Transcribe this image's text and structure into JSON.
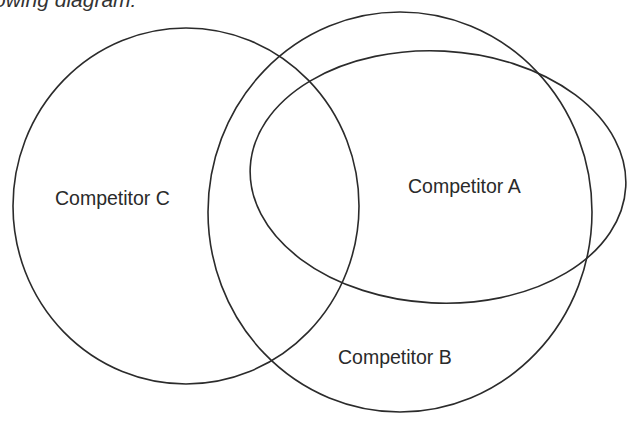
{
  "caption": {
    "text": "following diagram:",
    "visible_fragment": "owing diagram:"
  },
  "diagram": {
    "type": "venn",
    "stroke_color": "#2b2b2b",
    "sets": [
      {
        "id": "A",
        "label": "Competitor A",
        "shape": "ellipse",
        "cx": 438,
        "cy": 177,
        "rx": 188,
        "ry": 126,
        "rotation": 3,
        "label_x": 408,
        "label_y": 193
      },
      {
        "id": "B",
        "label": "Competitor B",
        "shape": "ellipse",
        "cx": 400,
        "cy": 212,
        "rx": 192,
        "ry": 200,
        "rotation": 0,
        "label_x": 338,
        "label_y": 364
      },
      {
        "id": "C",
        "label": "Competitor C",
        "shape": "ellipse",
        "cx": 186,
        "cy": 206,
        "rx": 173,
        "ry": 178,
        "rotation": 0,
        "label_x": 55,
        "label_y": 205
      }
    ],
    "relationships": [
      "Competitor A is largely contained within Competitor B",
      "Competitor A overlaps Competitor C",
      "Competitor B overlaps Competitor C"
    ]
  }
}
